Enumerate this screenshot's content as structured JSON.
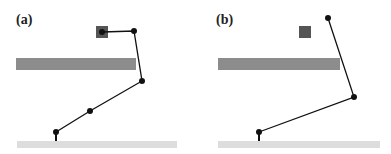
{
  "panels": [
    {
      "label": "(a)",
      "offset_x": 0,
      "obstacle_bar": {
        "x": 16,
        "y": 58,
        "w": 120,
        "h": 12,
        "color": "#8c8c8c"
      },
      "floor": {
        "x": 17,
        "y": 141,
        "w": 160,
        "h": 7,
        "color": "#dddddd"
      },
      "target_square": {
        "x": 96,
        "y": 26,
        "w": 12,
        "h": 12,
        "color": "#555555"
      },
      "joints": [
        [
          56,
          132
        ],
        [
          90,
          111
        ],
        [
          142,
          81
        ],
        [
          134,
          31
        ],
        [
          102,
          32
        ]
      ],
      "base_stub": [
        [
          56,
          132
        ],
        [
          56,
          141
        ]
      ]
    },
    {
      "label": "(b)",
      "offset_x": 195,
      "obstacle_bar": {
        "x": 23,
        "y": 58,
        "w": 122,
        "h": 12,
        "color": "#8c8c8c"
      },
      "floor": {
        "x": 23,
        "y": 141,
        "w": 162,
        "h": 7,
        "color": "#dddddd"
      },
      "target_square": {
        "x": 104,
        "y": 26,
        "w": 12,
        "h": 12,
        "color": "#555555"
      },
      "joints": [
        [
          64,
          132
        ],
        [
          159,
          97
        ],
        [
          133,
          18
        ]
      ],
      "base_stub": [
        [
          64,
          132
        ],
        [
          64,
          141
        ]
      ]
    }
  ]
}
